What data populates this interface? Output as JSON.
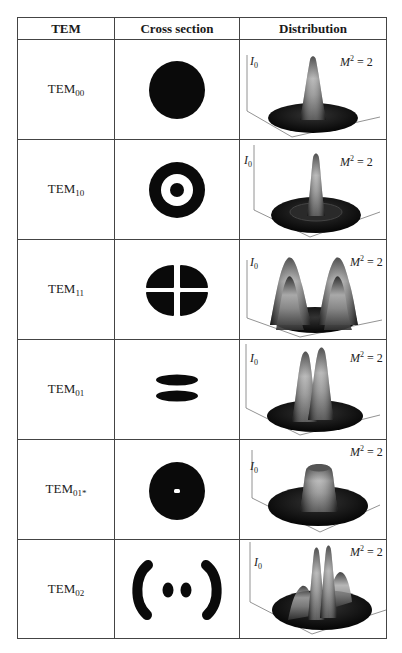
{
  "table": {
    "headers": [
      "TEM",
      "Cross section",
      "Distribution"
    ],
    "rows": [
      {
        "mode": "TEM",
        "subscript": "00",
        "cross_section": "solid-disk",
        "distribution": "single-central-peak",
        "axis_label": "I",
        "axis_sub": "0",
        "m2_label": "M",
        "m2_sup": "2",
        "m2_value": " = 2"
      },
      {
        "mode": "TEM",
        "subscript": "10",
        "cross_section": "ring-with-center-dot",
        "distribution": "central-peak-with-ring",
        "axis_label": "I",
        "axis_sub": "0",
        "m2_label": "M",
        "m2_sup": "2",
        "m2_value": " = 2"
      },
      {
        "mode": "TEM",
        "subscript": "11",
        "cross_section": "four-lobes",
        "distribution": "four-peaks",
        "axis_label": "I",
        "axis_sub": "0",
        "m2_label": "M",
        "m2_sup": "2",
        "m2_value": " = 2"
      },
      {
        "mode": "TEM",
        "subscript": "01",
        "cross_section": "two-horizontal-lobes",
        "distribution": "two-peaks",
        "axis_label": "I",
        "axis_sub": "0",
        "m2_label": "M",
        "m2_sup": "2",
        "m2_value": " = 2"
      },
      {
        "mode": "TEM",
        "subscript": "01*",
        "cross_section": "donut-with-small-hole",
        "distribution": "flat-top-donut",
        "axis_label": "I",
        "axis_sub": "0",
        "m2_label": "M",
        "m2_sup": "2",
        "m2_value": " = 2"
      },
      {
        "mode": "TEM",
        "subscript": "02",
        "cross_section": "two-arcs-two-dots",
        "distribution": "two-peaks-with-side-lobes",
        "axis_label": "I",
        "axis_sub": "0",
        "m2_label": "M",
        "m2_sup": "2",
        "m2_value": " = 2"
      }
    ]
  }
}
